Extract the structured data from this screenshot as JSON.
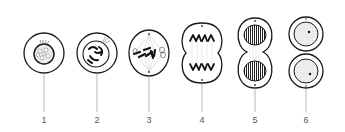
{
  "diagram": {
    "colors": {
      "stroke": "#1a1a1a",
      "leader": "#9a9a9a",
      "label": "#555555",
      "background": "#ffffff"
    },
    "stages": [
      {
        "label": "1",
        "x": 44,
        "shape": "round-cell",
        "description": "interphase / prophase nucleus"
      },
      {
        "label": "2",
        "x": 97,
        "shape": "round-cell",
        "description": "prophase with condensed chromosomes"
      },
      {
        "label": "3",
        "x": 149,
        "shape": "oval-cell",
        "description": "metaphase with spindle"
      },
      {
        "label": "4",
        "x": 202,
        "shape": "pinched-cell",
        "description": "anaphase"
      },
      {
        "label": "5",
        "x": 255,
        "shape": "dividing-cell",
        "description": "telophase"
      },
      {
        "label": "6",
        "x": 306,
        "shape": "two-daughter-cells",
        "description": "cytokinesis / daughter cells"
      }
    ]
  }
}
